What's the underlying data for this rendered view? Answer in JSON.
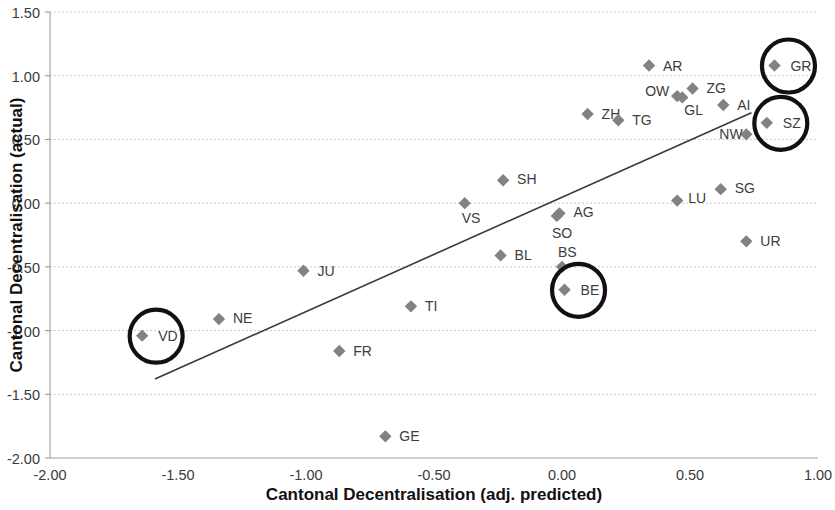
{
  "chart_data": {
    "type": "scatter",
    "title": "",
    "xlabel": "Cantonal Decentralisation (adj. predicted)",
    "ylabel": "Cantonal Decentralisation (actual)",
    "xlim": [
      -2.0,
      1.0
    ],
    "ylim": [
      -2.0,
      1.5
    ],
    "xticks": [
      "-2.00",
      "-1.50",
      "-1.00",
      "-0.50",
      "0.00",
      "0.50",
      "1.00"
    ],
    "xtick_values": [
      -2.0,
      -1.5,
      -1.0,
      -0.5,
      0.0,
      0.5,
      1.0
    ],
    "yticks": [
      "1.50",
      "1.00",
      "0.50",
      "0.00",
      "-0.50",
      "-1.00",
      "-1.50",
      "-2.00"
    ],
    "ytick_values": [
      1.5,
      1.0,
      0.5,
      0.0,
      -0.5,
      -1.0,
      -1.5,
      -2.0
    ],
    "grid": "horizontal-dashed",
    "legend": "none",
    "marker_shape": "diamond",
    "marker_color": "#828282",
    "trendline": {
      "type": "linear",
      "x_start": -1.59,
      "y_start": -1.38,
      "x_end": 0.74,
      "y_end": 0.71
    },
    "highlight_color": "#111111",
    "points": [
      {
        "label": "AR",
        "x": 0.34,
        "y": 1.08,
        "lx": 14,
        "ly": 5,
        "highlighted": false
      },
      {
        "label": "GR",
        "x": 0.83,
        "y": 1.08,
        "lx": 16,
        "ly": 5,
        "highlighted": true
      },
      {
        "label": "OW",
        "x": 0.45,
        "y": 0.84,
        "lx": -32,
        "ly": 0,
        "highlighted": false
      },
      {
        "label": "ZG",
        "x": 0.51,
        "y": 0.9,
        "lx": 14,
        "ly": 5,
        "highlighted": false
      },
      {
        "label": "GL",
        "x": 0.47,
        "y": 0.83,
        "lx": 2,
        "ly": 18,
        "highlighted": false
      },
      {
        "label": "AI",
        "x": 0.63,
        "y": 0.77,
        "lx": 14,
        "ly": 5,
        "highlighted": false
      },
      {
        "label": "ZH",
        "x": 0.1,
        "y": 0.7,
        "lx": 14,
        "ly": 5,
        "highlighted": false
      },
      {
        "label": "TG",
        "x": 0.22,
        "y": 0.65,
        "lx": 14,
        "ly": 5,
        "highlighted": false
      },
      {
        "label": "SZ",
        "x": 0.8,
        "y": 0.63,
        "lx": 16,
        "ly": 5,
        "highlighted": true
      },
      {
        "label": "NW",
        "x": 0.72,
        "y": 0.54,
        "lx": -27,
        "ly": 5,
        "highlighted": false
      },
      {
        "label": "SH",
        "x": -0.23,
        "y": 0.18,
        "lx": 14,
        "ly": 4,
        "highlighted": false
      },
      {
        "label": "SG",
        "x": 0.62,
        "y": 0.11,
        "lx": 14,
        "ly": 4,
        "highlighted": false
      },
      {
        "label": "LU",
        "x": 0.45,
        "y": 0.02,
        "lx": 11,
        "ly": 2,
        "highlighted": false
      },
      {
        "label": "VS",
        "x": -0.38,
        "y": 0.0,
        "lx": -3,
        "ly": 20,
        "highlighted": false
      },
      {
        "label": "AG",
        "x": -0.01,
        "y": -0.08,
        "lx": 14,
        "ly": 4,
        "highlighted": false
      },
      {
        "label": "SO",
        "x": -0.02,
        "y": -0.1,
        "lx": -5,
        "ly": 22,
        "highlighted": false
      },
      {
        "label": "UR",
        "x": 0.72,
        "y": -0.3,
        "lx": 14,
        "ly": 5,
        "highlighted": false
      },
      {
        "label": "BL",
        "x": -0.24,
        "y": -0.41,
        "lx": 14,
        "ly": 5,
        "highlighted": false
      },
      {
        "label": "BS",
        "x": 0.0,
        "y": -0.5,
        "lx": -4,
        "ly": -10,
        "highlighted": false
      },
      {
        "label": "JU",
        "x": -1.01,
        "y": -0.53,
        "lx": 14,
        "ly": 5,
        "highlighted": false
      },
      {
        "label": "BE",
        "x": 0.01,
        "y": -0.68,
        "lx": 16,
        "ly": 5,
        "highlighted": true
      },
      {
        "label": "TI",
        "x": -0.59,
        "y": -0.81,
        "lx": 14,
        "ly": 5,
        "highlighted": false
      },
      {
        "label": "NE",
        "x": -1.34,
        "y": -0.91,
        "lx": 14,
        "ly": 4,
        "highlighted": false
      },
      {
        "label": "VD",
        "x": -1.64,
        "y": -1.04,
        "lx": 16,
        "ly": 5,
        "highlighted": true
      },
      {
        "label": "FR",
        "x": -0.87,
        "y": -1.16,
        "lx": 14,
        "ly": 5,
        "highlighted": false
      },
      {
        "label": "GE",
        "x": -0.69,
        "y": -1.83,
        "lx": 14,
        "ly": 5,
        "highlighted": false
      }
    ]
  }
}
